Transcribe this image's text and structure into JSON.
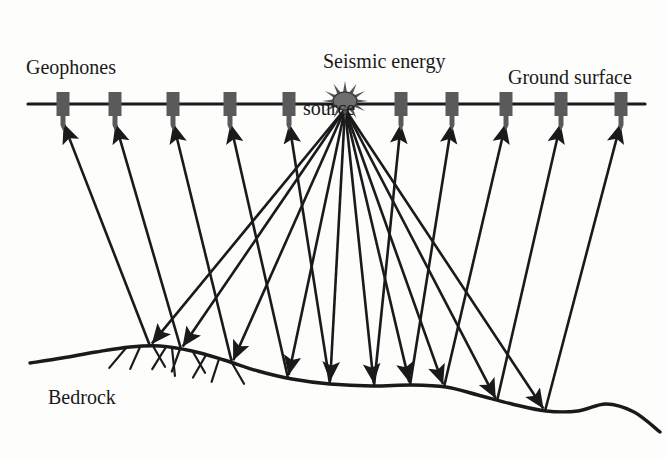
{
  "figure": {
    "kind": "seismic-reflection-survey-schematic",
    "width": 667,
    "height": 460,
    "background_color": "#fdfdfc",
    "ink_color": "#1a1a1a",
    "geophone_color": "#5a5a5a"
  },
  "labels": {
    "geophones": "Geophones",
    "source_line1": "Seismic energy",
    "source_line2": "source",
    "ground_surface": "Ground surface",
    "bedrock": "Bedrock"
  },
  "surface": {
    "name": "ground-surface-line",
    "y": 104,
    "x_start": 28,
    "x_end": 645,
    "stroke_width": 3.2
  },
  "source": {
    "name": "seismic-energy-source",
    "x": 345,
    "y": 101,
    "core_rx": 12,
    "core_ry": 9,
    "ray_count": 12,
    "ray_length": 11
  },
  "geophones": [
    {
      "id": "geophone-1",
      "x": 63
    },
    {
      "id": "geophone-2",
      "x": 115
    },
    {
      "id": "geophone-3",
      "x": 173
    },
    {
      "id": "geophone-4",
      "x": 230
    },
    {
      "id": "geophone-5",
      "x": 289
    },
    {
      "id": "geophone-6",
      "x": 401
    },
    {
      "id": "geophone-7",
      "x": 452
    },
    {
      "id": "geophone-8",
      "x": 506
    },
    {
      "id": "geophone-9",
      "x": 561
    },
    {
      "id": "geophone-10",
      "x": 621
    }
  ],
  "geophone_shape": {
    "body_width": 13,
    "body_height": 24,
    "body_top_offset": -12,
    "stem_width": 5,
    "stem_height": 9,
    "spike_height": 6
  },
  "bedrock": {
    "name": "bedrock-interface",
    "stroke_width": 3.4,
    "path_points": [
      [
        30,
        363
      ],
      [
        62,
        358
      ],
      [
        96,
        352
      ],
      [
        130,
        347
      ],
      [
        160,
        346
      ],
      [
        192,
        351
      ],
      [
        224,
        360
      ],
      [
        258,
        371
      ],
      [
        292,
        379
      ],
      [
        330,
        384
      ],
      [
        372,
        386
      ],
      [
        412,
        385
      ],
      [
        446,
        387
      ],
      [
        478,
        395
      ],
      [
        512,
        404
      ],
      [
        546,
        411
      ],
      [
        578,
        411
      ],
      [
        606,
        404
      ],
      [
        634,
        412
      ],
      [
        660,
        432
      ]
    ],
    "hatch_marks": [
      {
        "x": 126,
        "y": 348,
        "angle": 230,
        "len": 26
      },
      {
        "x": 140,
        "y": 347,
        "angle": 246,
        "len": 24
      },
      {
        "x": 153,
        "y": 346,
        "angle": 300,
        "len": 24
      },
      {
        "x": 166,
        "y": 347,
        "angle": 238,
        "len": 26
      },
      {
        "x": 180,
        "y": 349,
        "angle": 250,
        "len": 24
      },
      {
        "x": 193,
        "y": 352,
        "angle": 300,
        "len": 24
      },
      {
        "x": 206,
        "y": 355,
        "angle": 240,
        "len": 26
      },
      {
        "x": 219,
        "y": 359,
        "angle": 252,
        "len": 24
      },
      {
        "x": 232,
        "y": 363,
        "angle": 300,
        "len": 24
      },
      {
        "x": 172,
        "y": 348,
        "angle": 276,
        "len": 28
      }
    ]
  },
  "rays": {
    "description": "Down-going rays fan from the source to reflection points on bedrock; up-going rays return from each reflection point to a geophone.",
    "down_stroke_width": 2.6,
    "up_stroke_width": 2.6,
    "arrow_size": 9,
    "paths": [
      {
        "id": "ray-to-geophone-1",
        "reflect_x": 150,
        "reflect_y": 346,
        "receiver_x": 63,
        "receiver_y": 122
      },
      {
        "id": "ray-to-geophone-2",
        "reflect_x": 181,
        "reflect_y": 349,
        "receiver_x": 115,
        "receiver_y": 122
      },
      {
        "id": "ray-to-geophone-3",
        "reflect_x": 232,
        "reflect_y": 363,
        "receiver_x": 173,
        "receiver_y": 122
      },
      {
        "id": "ray-to-geophone-4",
        "reflect_x": 288,
        "reflect_y": 378,
        "receiver_x": 230,
        "receiver_y": 122
      },
      {
        "id": "ray-to-geophone-5",
        "reflect_x": 330,
        "reflect_y": 384,
        "receiver_x": 289,
        "receiver_y": 122
      },
      {
        "id": "ray-to-geophone-6",
        "reflect_x": 374,
        "reflect_y": 386,
        "receiver_x": 401,
        "receiver_y": 122
      },
      {
        "id": "ray-to-geophone-7",
        "reflect_x": 410,
        "reflect_y": 385,
        "receiver_x": 452,
        "receiver_y": 122
      },
      {
        "id": "ray-to-geophone-8",
        "reflect_x": 444,
        "reflect_y": 387,
        "receiver_x": 506,
        "receiver_y": 122
      },
      {
        "id": "ray-to-geophone-9",
        "reflect_x": 497,
        "reflect_y": 401,
        "receiver_x": 561,
        "receiver_y": 122
      },
      {
        "id": "ray-to-geophone-10",
        "reflect_x": 545,
        "reflect_y": 411,
        "receiver_x": 621,
        "receiver_y": 122
      }
    ]
  }
}
